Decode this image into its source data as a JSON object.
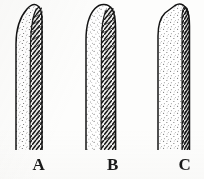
{
  "plate": {
    "background_color": "#fdfdfc",
    "ink_color": "#1a1a1a",
    "style": "scanned black-and-white botanical line drawing",
    "width": 204,
    "height": 179
  },
  "figures": [
    {
      "id": "A",
      "label": "A",
      "apex_shape": "acute, obliquely pointed apex leaning right",
      "shaft": "narrow elongate shaft, cut off at lower edge",
      "left_surface": "stippled / finely dotted pale surface",
      "right_surface": "dark herringbone-hatched band along the right margin",
      "midrib": "visible central midrib line running full length",
      "hatch_direction": "oblique chevron hatching angled upward to the midrib",
      "outline_color": "#141414",
      "stipple_color": "#5a5a5a",
      "hatch_color": "#1c1c1c"
    },
    {
      "id": "B",
      "label": "B",
      "apex_shape": "obtuse, broadly rounded apex",
      "shaft": "straight parallel-sided shaft, cut off at lower edge",
      "left_surface": "stippled / finely dotted pale surface",
      "right_surface": "dark herringbone-hatched band along the right margin",
      "midrib": "visible central midrib line running full length",
      "hatch_direction": "oblique chevron hatching angled upward to the midrib",
      "outline_color": "#141414",
      "stipple_color": "#5a5a5a",
      "hatch_color": "#1c1c1c"
    },
    {
      "id": "C",
      "label": "C",
      "apex_shape": "truncate, flattened apex with angled shoulders",
      "shaft": "broad parallel-sided shaft, cut off at lower edge",
      "left_surface": "stippled / finely dotted pale surface",
      "right_surface": "narrow dark hatched band along the right margin",
      "midrib": "faint marginal line near the right edge",
      "hatch_direction": "short oblique hatch strokes along the right margin",
      "outline_color": "#141414",
      "stipple_color": "#5a5a5a",
      "hatch_color": "#1c1c1c"
    }
  ],
  "labels": {
    "a": "A",
    "b": "B",
    "c": "C"
  }
}
